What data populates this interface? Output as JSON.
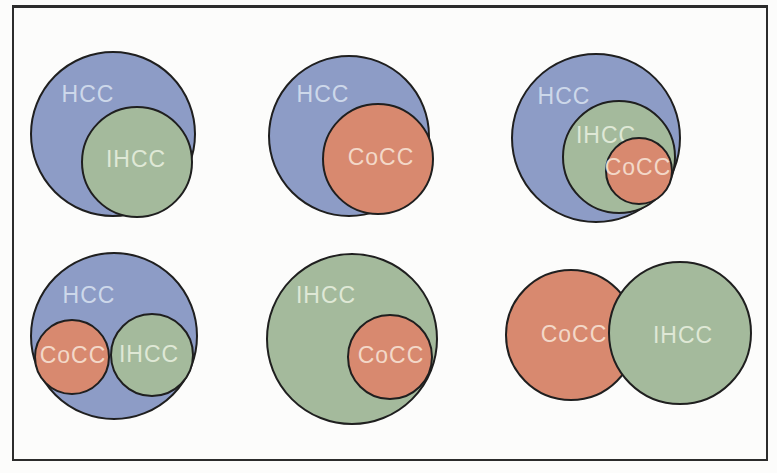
{
  "figure": {
    "type": "venn-diagram-panel-grid",
    "grid": "2 rows x 3 columns",
    "background": "#fcfcfb",
    "frame_color": "#2c2c2c"
  },
  "palette": {
    "hcc_fill": "#8d9cc6",
    "ihcc_fill": "#a4ba9c",
    "cocc_fill": "#d8896f",
    "circle_outline": "#1f1f1f",
    "label_on_hcc": "#cdd8ea",
    "label_on_ihcc": "#dfe8d6",
    "label_on_cocc": "#f3d8c8"
  },
  "labels": {
    "hcc": "HCC",
    "ihcc": "IHCC",
    "cocc": "CoCC"
  },
  "diagrams": [
    {
      "position": "top-left",
      "relation": "IHCC inside HCC",
      "circles": [
        "HCC",
        "IHCC"
      ]
    },
    {
      "position": "top-middle",
      "relation": "CoCC inside HCC",
      "circles": [
        "HCC",
        "CoCC"
      ]
    },
    {
      "position": "top-right",
      "relation": "CoCC inside IHCC inside HCC",
      "circles": [
        "HCC",
        "IHCC",
        "CoCC"
      ]
    },
    {
      "position": "bottom-left",
      "relation": "CoCC and IHCC side by side inside HCC",
      "circles": [
        "HCC",
        "CoCC",
        "IHCC"
      ]
    },
    {
      "position": "bottom-middle",
      "relation": "CoCC inside IHCC",
      "circles": [
        "IHCC",
        "CoCC"
      ]
    },
    {
      "position": "bottom-right",
      "relation": "CoCC overlapping IHCC",
      "circles": [
        "CoCC",
        "IHCC"
      ]
    }
  ]
}
